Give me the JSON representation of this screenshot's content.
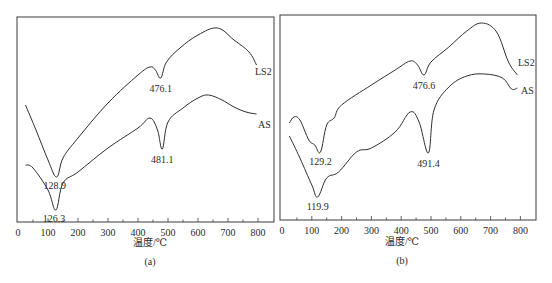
{
  "chart_data": [
    {
      "id": "a",
      "type": "line",
      "panel_label": "(a)",
      "xlabel": "温度/℃",
      "ylabel": "",
      "xlim": [
        0,
        850
      ],
      "xticks": [
        0,
        100,
        200,
        300,
        400,
        500,
        600,
        700,
        800
      ],
      "grid": false,
      "legend": "inline labels at right end of curves",
      "series": [
        {
          "name": "LS2",
          "x": [
            25,
            60,
            100,
            128.9,
            150,
            200,
            300,
            400,
            440,
            458,
            476.1,
            495,
            540,
            600,
            665,
            720,
            770,
            795
          ],
          "y_px": [
            105,
            130,
            160,
            177,
            158,
            138,
            103,
            75,
            67,
            70,
            78,
            62,
            48,
            35,
            28,
            40,
            52,
            65
          ],
          "annotations": [
            {
              "x": 128.9,
              "label": "128.9"
            },
            {
              "x": 476.1,
              "label": "476.1"
            }
          ]
        },
        {
          "name": "AS",
          "x": [
            25,
            50,
            100,
            126.3,
            150,
            200,
            300,
            400,
            440,
            465,
            481.1,
            500,
            550,
            600,
            635,
            680,
            720,
            760,
            795
          ],
          "y_px": [
            165,
            168,
            190,
            210,
            183,
            172,
            148,
            128,
            118,
            130,
            149,
            122,
            108,
            98,
            95,
            100,
            107,
            112,
            114
          ],
          "annotations": [
            {
              "x": 126.3,
              "label": "126.3"
            },
            {
              "x": 481.1,
              "label": "481.1"
            }
          ]
        }
      ]
    },
    {
      "id": "b",
      "type": "line",
      "panel_label": "(b)",
      "xlabel": "温度/℃",
      "ylabel": "",
      "xlim": [
        0,
        850
      ],
      "xticks": [
        0,
        100,
        200,
        300,
        400,
        500,
        600,
        700,
        800
      ],
      "grid": false,
      "legend": "inline labels at right end of curves",
      "series": [
        {
          "name": "LS2",
          "x": [
            25,
            40,
            60,
            90,
            110,
            129.2,
            150,
            175,
            200,
            300,
            380,
            430,
            455,
            476.6,
            500,
            560,
            620,
            670,
            720,
            760,
            790
          ],
          "y_px": [
            123,
            117,
            120,
            140,
            145,
            152,
            125,
            118,
            105,
            85,
            70,
            61,
            65,
            75,
            62,
            47,
            31,
            23,
            32,
            62,
            75
          ],
          "annotations": [
            {
              "x": 129.2,
              "label": "129.2"
            },
            {
              "x": 476.6,
              "label": "476.6"
            }
          ]
        },
        {
          "name": "AS",
          "x": [
            25,
            60,
            100,
            119.9,
            150,
            190,
            250,
            300,
            380,
            430,
            460,
            491.4,
            510,
            560,
            620,
            680,
            740,
            770,
            790
          ],
          "y_px": [
            136,
            158,
            185,
            197,
            178,
            172,
            152,
            148,
            132,
            112,
            122,
            153,
            110,
            87,
            76,
            74,
            78,
            89,
            88
          ],
          "annotations": [
            {
              "x": 119.9,
              "label": "119.9"
            },
            {
              "x": 491.4,
              "label": "491.4"
            }
          ]
        }
      ]
    }
  ],
  "panels": {
    "a": {
      "label": "(a)",
      "xlabel": "温度/℃",
      "ticks": [
        "0",
        "100",
        "200",
        "300",
        "400",
        "500",
        "600",
        "700",
        "800"
      ],
      "series_labels": [
        "LS2",
        "AS"
      ]
    },
    "b": {
      "label": "(b)",
      "xlabel": "温度/℃",
      "ticks": [
        "0",
        "100",
        "200",
        "300",
        "400",
        "500",
        "600",
        "700",
        "800"
      ],
      "series_labels": [
        "LS2",
        "AS"
      ]
    }
  }
}
